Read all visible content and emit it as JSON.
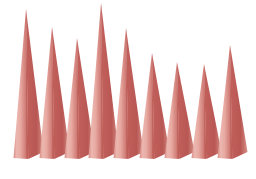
{
  "chart_data": {
    "type": "bar",
    "render_style": "3d-cone",
    "title": "",
    "subtitle": "",
    "xlabel": "",
    "ylabel": "",
    "grid": false,
    "legend": false,
    "legend_position": "none",
    "categories": [
      "1",
      "2",
      "3",
      "4",
      "5",
      "6",
      "7",
      "8",
      "9"
    ],
    "values": [
      149,
      131,
      120,
      155,
      130,
      105,
      96,
      94,
      113
    ],
    "ylim": [
      0,
      158
    ],
    "xlim": [
      0,
      9
    ],
    "series": [
      {
        "name": "Series 1",
        "values": [
          149,
          131,
          120,
          155,
          130,
          105,
          96,
          94,
          113
        ]
      }
    ],
    "tick_labels_x": [],
    "tick_labels_y": [],
    "annotations": []
  },
  "style": {
    "background_color": "#FFFFFF",
    "cone_light_color": "#E9AFA8",
    "cone_mid_color": "#DD9189",
    "cone_dark_color": "#C2605C",
    "cone_edge_color": "#B8534F",
    "baseline_y": 158,
    "cone_half_width": 12.5,
    "cone_depth_x": 5,
    "cone_depth_y": 6
  },
  "geometry": {
    "canvas_width": 256,
    "canvas_height": 179,
    "cone_centers_x": [
      26,
      52,
      77,
      101,
      126,
      152,
      177,
      204,
      230
    ],
    "cone_tips_y": [
      9,
      27,
      38,
      3,
      28,
      53,
      62,
      64,
      45
    ]
  }
}
